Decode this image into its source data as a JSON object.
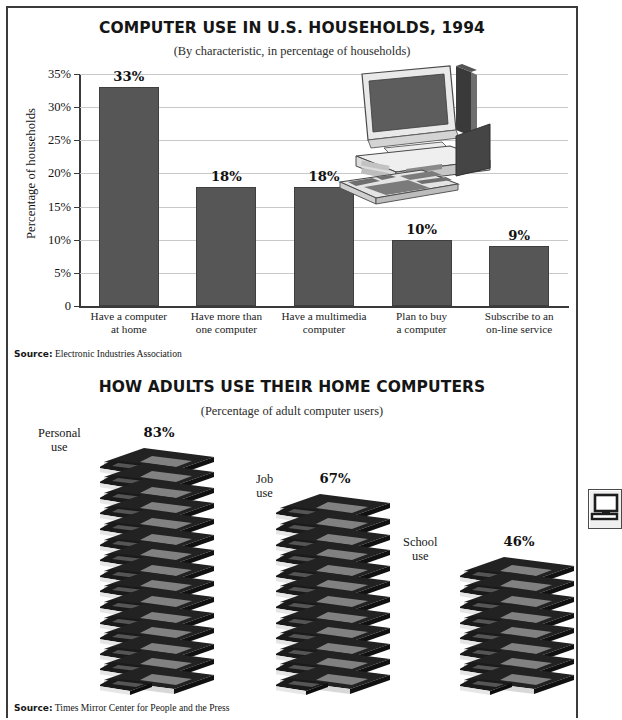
{
  "page": {
    "background_color": "#ffffff",
    "frame_color": "#3b3b3b"
  },
  "chart_data": [
    {
      "id": "computer-use-households",
      "type": "bar",
      "title": "COMPUTER USE IN U.S. HOUSEHOLDS, 1994",
      "subtitle": "(By characteristic, in percentage of households)",
      "xlabel": "",
      "ylabel": "Percentage of households",
      "ylim": [
        0,
        35
      ],
      "ytick_values": [
        0,
        5,
        10,
        15,
        20,
        25,
        30,
        35
      ],
      "ytick_labels": [
        "0",
        "5%",
        "10%",
        "15%",
        "20%",
        "25%",
        "30%",
        "35%"
      ],
      "grid": true,
      "legend": "none",
      "bar_color": "#565656",
      "categories": [
        "Have a computer\nat home",
        "Have more than\none computer",
        "Have a multimedia\ncomputer",
        "Plan to buy\na computer",
        "Subscribe to an\non-line service"
      ],
      "values": [
        33,
        18,
        18,
        10,
        9
      ],
      "value_labels": [
        "33%",
        "18%",
        "18%",
        "10%",
        "9%"
      ],
      "source_prefix": "Source:",
      "source_text": "Electronic Industries Association",
      "decoration": "desktop-computer-illustration"
    },
    {
      "id": "how-adults-use-home-computers",
      "type": "bar",
      "title": "HOW ADULTS USE THEIR HOME COMPUTERS",
      "subtitle": "(Percentage of adult computer users)",
      "xlabel": "",
      "ylabel": "",
      "ylim": [
        0,
        100
      ],
      "grid": false,
      "legend": "none",
      "pictogram": "stacked-computer-layers",
      "categories": [
        "Personal\nuse",
        "Job\nuse",
        "School\nuse"
      ],
      "values": [
        83,
        67,
        46
      ],
      "value_labels": [
        "83%",
        "67%",
        "46%"
      ],
      "layer_counts": [
        15,
        12,
        8
      ],
      "source_prefix": "Source:",
      "source_text": "Times Mirror Center for People and the Press"
    }
  ],
  "top_chart": {
    "title": "COMPUTER USE IN U.S. HOUSEHOLDS, 1994",
    "subtitle": "(By characteristic, in percentage of households)",
    "ylabel": "Percentage of households",
    "yticks": [
      {
        "label": "35%",
        "value": 35
      },
      {
        "label": "30%",
        "value": 30
      },
      {
        "label": "25%",
        "value": 25
      },
      {
        "label": "20%",
        "value": 20
      },
      {
        "label": "15%",
        "value": 15
      },
      {
        "label": "10%",
        "value": 10
      },
      {
        "label": "5%",
        "value": 5
      },
      {
        "label": "0",
        "value": 0
      }
    ],
    "bars": [
      {
        "label_line1": "Have a computer",
        "label_line2": "at home",
        "value": 33,
        "value_label": "33%"
      },
      {
        "label_line1": "Have more than",
        "label_line2": "one computer",
        "value": 18,
        "value_label": "18%"
      },
      {
        "label_line1": "Have a multimedia",
        "label_line2": "computer",
        "value": 18,
        "value_label": "18%"
      },
      {
        "label_line1": "Plan to buy",
        "label_line2": "a computer",
        "value": 10,
        "value_label": "10%"
      },
      {
        "label_line1": "Subscribe to an",
        "label_line2": "on-line service",
        "value": 9,
        "value_label": "9%"
      }
    ],
    "source_prefix": "Source:",
    "source_text": "Electronic Industries Association"
  },
  "bottom_chart": {
    "title": "HOW ADULTS USE THEIR HOME COMPUTERS",
    "subtitle": "(Percentage of adult computer users)",
    "stacks": [
      {
        "label_line1": "Personal",
        "label_line2": "use",
        "value": 83,
        "value_label": "83%",
        "layers": 15
      },
      {
        "label_line1": "Job",
        "label_line2": "use",
        "value": 67,
        "value_label": "67%",
        "layers": 12
      },
      {
        "label_line1": "School",
        "label_line2": "use",
        "value": 46,
        "value_label": "46%",
        "layers": 8
      }
    ],
    "source_prefix": "Source:",
    "source_text": "Times Mirror Center for People and the Press"
  },
  "edge_icon": {
    "name": "computer-monitor-icon"
  }
}
